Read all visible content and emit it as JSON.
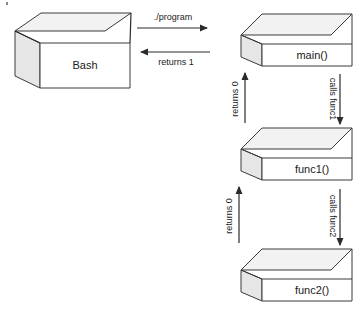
{
  "diagram": {
    "type": "block-flow-diagram",
    "background_color": "#ffffff",
    "box_fill_color": "#ffffff",
    "box_top_color": "#f2f2f2",
    "box_side_color": "#e6e6e6",
    "box_stroke_color": "#3a3a3a",
    "arrow_color": "#2b2b2b",
    "text_color": "#1a1a1a",
    "boxes": [
      {
        "id": "bash",
        "label": "Bash"
      },
      {
        "id": "main",
        "label": "main()"
      },
      {
        "id": "func1",
        "label": "func1()"
      },
      {
        "id": "func2",
        "label": "func2()"
      }
    ],
    "arrows": [
      {
        "id": "invoke-program",
        "label": "./program",
        "from": "bash",
        "to": "main",
        "direction": "right"
      },
      {
        "id": "return-to-bash",
        "label": "returns 1",
        "from": "main",
        "to": "bash",
        "direction": "left"
      },
      {
        "id": "call-func1",
        "label": "calls func1",
        "from": "main",
        "to": "func1",
        "direction": "down"
      },
      {
        "id": "return-func1",
        "label": "returns 0",
        "from": "func1",
        "to": "main",
        "direction": "up"
      },
      {
        "id": "call-func2",
        "label": "calls func2",
        "from": "func1",
        "to": "func2",
        "direction": "down"
      },
      {
        "id": "return-func2",
        "label": "returns 0",
        "from": "func2",
        "to": "func1",
        "direction": "up"
      }
    ]
  }
}
